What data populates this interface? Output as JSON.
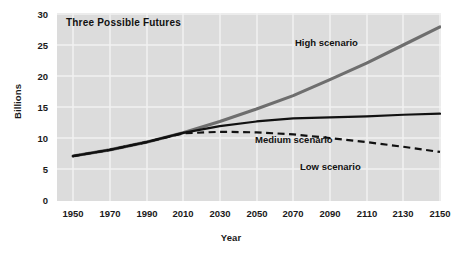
{
  "chart_data": {
    "type": "line",
    "title": "Three Possible Futures",
    "xlabel": "Year",
    "ylabel": "Billions",
    "xlim": [
      1950,
      2150
    ],
    "ylim": [
      0,
      30
    ],
    "grid": true,
    "legend": "inline-annotations",
    "x_ticks": [
      "1950",
      "1970",
      "1990",
      "2010",
      "2030",
      "2050",
      "2070",
      "2090",
      "2110",
      "2130",
      "2150"
    ],
    "y_ticks": [
      "0",
      "5",
      "10",
      "15",
      "20",
      "25",
      "30"
    ],
    "x": [
      1950,
      1970,
      1990,
      2010,
      2030,
      2050,
      2070,
      2090,
      2110,
      2130,
      2150
    ],
    "series": [
      {
        "name": "High scenario",
        "style": "solid-thick-gray",
        "color": "#6e6e6e",
        "values": [
          2.5,
          3.7,
          5.2,
          7.0,
          9.2,
          11.6,
          14.2,
          17.3,
          20.5,
          24.0,
          27.5
        ]
      },
      {
        "name": "Medium scenario",
        "style": "solid-thin-black",
        "color": "#111111",
        "values": [
          2.5,
          3.7,
          5.2,
          7.0,
          8.3,
          9.2,
          9.8,
          10.0,
          10.2,
          10.5,
          10.7
        ]
      },
      {
        "name": "Low scenario",
        "style": "dashed-black",
        "color": "#111111",
        "values": [
          2.5,
          3.7,
          5.2,
          6.9,
          7.2,
          7.1,
          6.7,
          6.0,
          5.2,
          4.3,
          3.3
        ]
      }
    ],
    "annotations": [
      {
        "text": "High scenario",
        "x": 2085,
        "y": 23.0
      },
      {
        "text": "Medium scenario",
        "x": 2075,
        "y": 12.4
      },
      {
        "text": "Low scenario",
        "x": 2085,
        "y": 8.6
      }
    ],
    "colors": {
      "plot_background": "#dcdcdc",
      "gridline": "#f2f2f2",
      "page_background": "#ffffff",
      "text": "#111111"
    }
  }
}
